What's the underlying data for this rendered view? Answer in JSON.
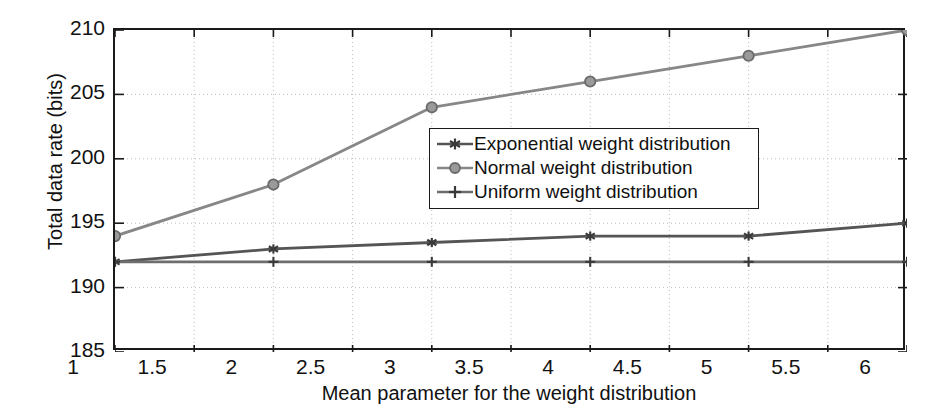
{
  "chart_data": {
    "type": "line",
    "title": "",
    "xlabel": "Mean parameter for the weight distribution",
    "ylabel": "Total data rate (bits)",
    "xlim": [
      1,
      6
    ],
    "ylim": [
      185,
      210
    ],
    "xticks": [
      "1",
      "1.5",
      "2",
      "2.5",
      "3",
      "3.5",
      "4",
      "4.5",
      "5",
      "5.5",
      "6"
    ],
    "xtick_values": [
      1,
      1.5,
      2,
      2.5,
      3,
      3.5,
      4,
      4.5,
      5,
      5.5,
      6
    ],
    "yticks": [
      "185",
      "190",
      "195",
      "200",
      "205",
      "210"
    ],
    "ytick_values": [
      185,
      190,
      195,
      200,
      205,
      210
    ],
    "grid": true,
    "grid_style": "dotted",
    "legend_position": "center",
    "x": [
      1,
      2,
      3,
      4,
      5,
      6
    ],
    "series": [
      {
        "name": "Exponential weight distribution",
        "values": [
          192,
          193,
          193.5,
          194,
          194,
          195
        ],
        "color": "#555555",
        "marker": "star"
      },
      {
        "name": "Normal weight distribution",
        "values": [
          194,
          198,
          204,
          206,
          208,
          210
        ],
        "color": "#878787",
        "marker": "circle"
      },
      {
        "name": "Uniform weight distribution",
        "values": [
          192,
          192,
          192,
          192,
          192,
          192
        ],
        "color": "#6e6e6e",
        "marker": "plus"
      }
    ]
  },
  "legend": {
    "items": [
      {
        "label": "Exponential weight distribution"
      },
      {
        "label": "Normal weight distribution"
      },
      {
        "label": "Uniform weight distribution"
      }
    ]
  },
  "axes": {
    "axis_color": "#1a1a1a",
    "grid_color": "#bdbdbd"
  }
}
